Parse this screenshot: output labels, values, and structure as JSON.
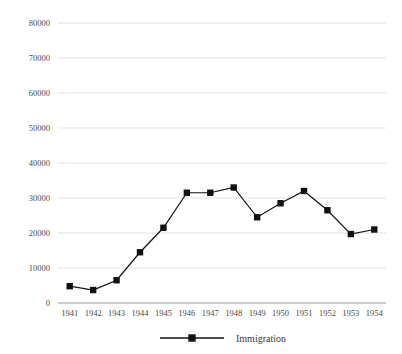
{
  "chart_data": {
    "type": "line",
    "title": "",
    "xlabel": "",
    "ylabel": "",
    "categories": [
      "1941",
      "1942",
      "1943",
      "1944",
      "1945",
      "1946",
      "1947",
      "1948",
      "1949",
      "1950",
      "1951",
      "1952",
      "1953",
      "1954"
    ],
    "series": [
      {
        "name": "Immigration",
        "values": [
          4800,
          3700,
          6500,
          14500,
          21500,
          31500,
          31500,
          33000,
          24500,
          28500,
          32000,
          26500,
          19700,
          21000
        ]
      }
    ],
    "ylim": [
      0,
      80000
    ],
    "ytick_step": 10000,
    "yticks": [
      "0",
      "10000",
      "20000",
      "30000",
      "40000",
      "50000",
      "60000",
      "70000",
      "80000"
    ],
    "ytick_values": [
      0,
      10000,
      20000,
      30000,
      40000,
      50000,
      60000,
      70000,
      80000
    ],
    "grid": true,
    "legend_position": "bottom",
    "marker": "square",
    "colors": {
      "series": "#111111",
      "gridline": "#e2e2e2",
      "axis": "#bdbdbd",
      "tick_text": "#4a4a4a",
      "legend_text": "#3a3a3a",
      "background": "#ffffff"
    }
  },
  "legend": {
    "entries": [
      {
        "label": "Immigration",
        "marker": "square-marker"
      }
    ]
  }
}
